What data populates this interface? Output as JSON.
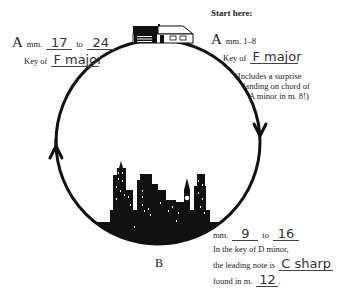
{
  "header": {
    "start_label": "Start here:"
  },
  "section_a_start": {
    "letter": "A",
    "measures_text": "mm. 1–8",
    "key_prefix": "Key of",
    "key_answer": "F major",
    "note_line1": "(Includes a surprise",
    "note_line2": "landing on chord of",
    "note_line3": "A minor in m. 8!)"
  },
  "section_a_return": {
    "letter": "A",
    "mm_label": "mm.",
    "from_answer": "17",
    "to_label": "to",
    "to_answer": "24",
    "key_prefix": "Key of",
    "key_answer": "F major"
  },
  "section_b": {
    "letter": "B",
    "mm_label": "mm.",
    "from_answer": "9",
    "to_label": "to",
    "to_answer": "16",
    "line2": "In the key of D minor,",
    "line3_prefix": "the leading note is",
    "leading_note_answer": "C sharp",
    "line4_prefix": "found in m.",
    "measure_answer": "12",
    "line4_suffix": "."
  },
  "diagram": {
    "circle_color": "#111111",
    "icons": [
      "house-icon",
      "city-skyline-icon",
      "arrow-up-icon",
      "arrow-down-icon"
    ]
  }
}
